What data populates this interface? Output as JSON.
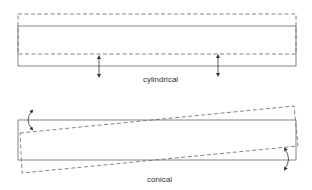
{
  "colors": {
    "line": "#555555",
    "text": "#333333",
    "background": "#ffffff"
  },
  "diagrams": [
    {
      "id": "cylindrical",
      "label": "cylindrical",
      "solid_rect": {
        "x1": 18,
        "y1": 26,
        "x2": 296,
        "y2": 66
      },
      "dashed_rect": {
        "x1": 18,
        "y1": 14,
        "x2": 296,
        "y2": 54
      },
      "arrows": [
        {
          "type": "double-vertical",
          "x": 99,
          "y1": 56,
          "y2": 77
        },
        {
          "type": "double-vertical",
          "x": 218,
          "y1": 55,
          "y2": 76
        }
      ]
    },
    {
      "id": "conical",
      "label": "conical",
      "solid_rect": {
        "x1": 18,
        "y1": 120,
        "x2": 296,
        "y2": 160
      },
      "dashed_quad": {
        "tl": [
          20,
          133
        ],
        "tr": [
          294,
          106
        ],
        "br": [
          298,
          146
        ],
        "bl": [
          22,
          173
        ]
      },
      "arrows": [
        {
          "type": "curved-double",
          "start": [
            32,
            110
          ],
          "end": [
            32,
            130
          ],
          "bulge": "left"
        },
        {
          "type": "curved-double",
          "start": [
            285,
            148
          ],
          "end": [
            285,
            170
          ],
          "bulge": "right"
        }
      ]
    }
  ]
}
